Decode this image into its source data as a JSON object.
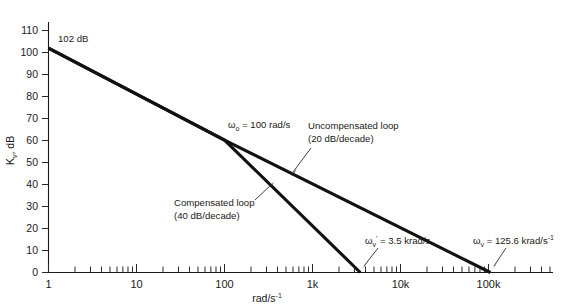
{
  "figure": {
    "background_color": "#ffffff",
    "line_color": "#111111",
    "axis_color": "#1a1a1a"
  },
  "chart_data": {
    "type": "line",
    "title": "",
    "xlabel": "rad/s",
    "xlabel_exponent": "-1",
    "ylabel": "K",
    "ylabel_subscript": "v",
    "ylabel_units": ", dB",
    "xscale": "log",
    "xlim": [
      1,
      1000000
    ],
    "ylim": [
      0,
      115
    ],
    "grid": false,
    "legend": "none",
    "xticks": [
      1,
      10,
      1000,
      10000,
      100000
    ],
    "xtick_labels": [
      "1",
      "10",
      "100",
      "1k",
      "10k",
      "100k"
    ],
    "xtick_values": [
      1,
      10,
      100,
      1000,
      10000,
      100000
    ],
    "yticks": [
      0,
      10,
      20,
      30,
      40,
      50,
      60,
      70,
      80,
      90,
      100,
      110
    ],
    "ytick_labels": [
      "0",
      "10",
      "20",
      "30",
      "40",
      "50",
      "60",
      "70",
      "80",
      "90",
      "100",
      "110"
    ],
    "series": [
      {
        "name": "Uncompensated loop",
        "slope_db_per_decade": -20,
        "points_freq_db": [
          [
            1,
            102
          ],
          [
            100,
            62
          ],
          [
            125600,
            0
          ]
        ]
      },
      {
        "name": "Compensated loop",
        "slope_db_per_decade": -40,
        "points_freq_db": [
          [
            1,
            102
          ],
          [
            100,
            62
          ],
          [
            3500,
            0
          ]
        ]
      }
    ],
    "annotations": [
      {
        "id": "start-gain",
        "text": "102 dB",
        "freq": 1,
        "db": 102
      },
      {
        "id": "corner-frequency",
        "symbol": "ω",
        "subscript": "o",
        "text": " = 100 rad/s",
        "freq": 100,
        "db": 62
      },
      {
        "id": "uncompensated-loop",
        "line1": "Uncompensated loop",
        "line2": "(20 dB/decade)",
        "points_to_freq": 450,
        "points_to_db": 50
      },
      {
        "id": "compensated-loop",
        "line1": "Compensated loop",
        "line2": "(40 dB/decade)",
        "points_to_freq": 300,
        "points_to_db": 41
      },
      {
        "id": "compensated-crossover",
        "symbol": "ω",
        "subscript": "v",
        "prime": "'",
        "text": " = 3.5 krad/s",
        "freq": 3500,
        "db": 0
      },
      {
        "id": "uncompensated-crossover",
        "symbol": "ω",
        "subscript": "v",
        "text": " = 125.6 krad/s",
        "exponent": "-1",
        "freq": 125600,
        "db": 0
      }
    ]
  }
}
